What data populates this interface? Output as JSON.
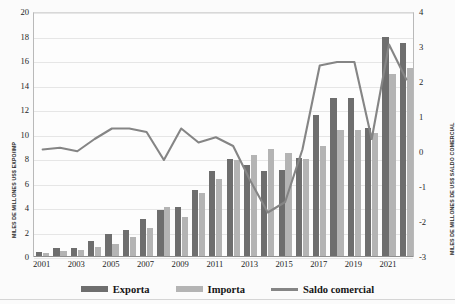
{
  "chart_data": {
    "type": "bar",
    "title": "",
    "xlabel": "",
    "ylabel": "MILES DE MILLONES US$ EXPO/IMP",
    "ylabel_right": "MILES DE MILLONES DE US$ SALDO COMERCIAL",
    "ylim": [
      0,
      20
    ],
    "ylim_right": [
      -3,
      4
    ],
    "yticks": [
      0,
      2,
      4,
      6,
      8,
      10,
      12,
      14,
      16,
      18,
      20
    ],
    "yticks_right": [
      -3,
      -2,
      -1,
      0,
      1,
      2,
      3,
      4
    ],
    "grid": true,
    "legend_position": "bottom",
    "categories": [
      "2001",
      "2002",
      "2003",
      "2004",
      "2005",
      "2006",
      "2007",
      "2008",
      "2009",
      "2010",
      "2011",
      "2012",
      "2013",
      "2014",
      "2015",
      "2016",
      "2017",
      "2018",
      "2019",
      "2020",
      "2021",
      "2022"
    ],
    "xtick_labels": [
      "2001",
      "2003",
      "2005",
      "2007",
      "2009",
      "2011",
      "2013",
      "2015",
      "2017",
      "2019",
      "2021"
    ],
    "series": [
      {
        "name": "Exporta",
        "type": "bar",
        "axis": "left",
        "color": "#6e6e6e",
        "values": [
          0.4,
          0.7,
          0.7,
          1.3,
          1.9,
          2.2,
          3.1,
          3.8,
          4.1,
          5.5,
          7.0,
          8.0,
          7.5,
          7.0,
          7.1,
          8.1,
          11.6,
          13.0,
          13.0,
          10.5,
          18.0,
          17.5
        ]
      },
      {
        "name": "Importa",
        "type": "bar",
        "axis": "left",
        "color": "#b4b4b4",
        "values": [
          0.3,
          0.5,
          0.6,
          0.8,
          1.1,
          1.6,
          2.4,
          4.1,
          3.3,
          5.2,
          6.4,
          7.9,
          8.3,
          8.8,
          8.5,
          8.0,
          9.1,
          10.4,
          10.4,
          10.1,
          14.9,
          15.4
        ]
      },
      {
        "name": "Saldo comercial",
        "type": "line",
        "axis": "right",
        "color": "#858585",
        "values": [
          0.1,
          0.15,
          0.05,
          0.4,
          0.7,
          0.7,
          0.6,
          -0.2,
          0.7,
          0.3,
          0.45,
          0.2,
          -0.8,
          -1.7,
          -1.4,
          0.1,
          2.5,
          2.6,
          2.6,
          0.4,
          3.1,
          2.1
        ]
      }
    ]
  },
  "legend": {
    "items": [
      {
        "label": "Exporta",
        "glyph": "bar-swatch",
        "color": "#6e6e6e"
      },
      {
        "label": "Importa",
        "glyph": "bar-swatch",
        "color": "#b4b4b4"
      },
      {
        "label": "Saldo comercial",
        "glyph": "line-swatch",
        "color": "#858585"
      }
    ]
  }
}
